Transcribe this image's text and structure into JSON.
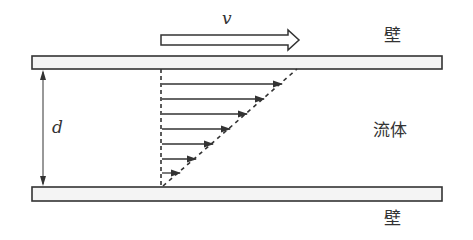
{
  "diagram": {
    "labels": {
      "velocity": "v",
      "gap": "d",
      "top_wall": "壁",
      "fluid": "流体",
      "bottom_wall": "壁"
    },
    "colors": {
      "line": "#333333",
      "wall_fill": "#f4f4f4",
      "background": "#ffffff"
    },
    "geometry": {
      "top_wall": {
        "x": 32,
        "y": 56,
        "width": 410,
        "height": 13
      },
      "bottom_wall": {
        "x": 32,
        "y": 187,
        "width": 410,
        "height": 14
      },
      "profile_origin_x": 161,
      "profile_diagonal": {
        "x1": 161,
        "y1": 187,
        "x2": 297,
        "y2": 69
      },
      "velocity_arrows_y": [
        84,
        99,
        114,
        129,
        144,
        159,
        173
      ],
      "velocity_arrow_count": 7
    }
  }
}
